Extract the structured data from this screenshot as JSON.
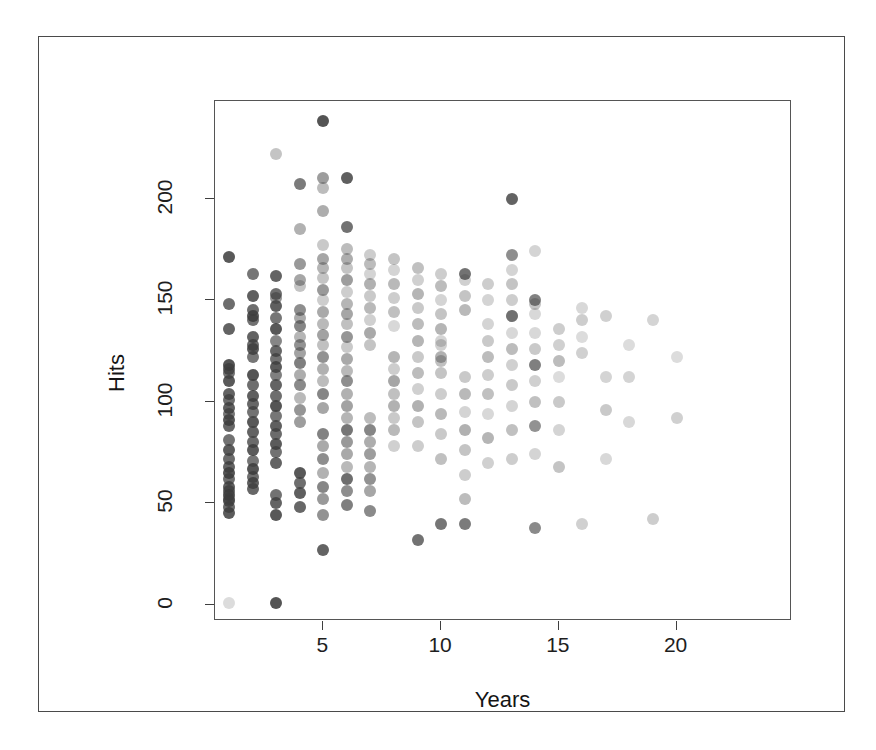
{
  "chart_data": {
    "type": "scatter",
    "title": "",
    "xlabel": "Years",
    "ylabel": "Hits",
    "xlim": [
      0.4,
      24.9
    ],
    "ylim": [
      -8,
      248
    ],
    "grid": false,
    "legend": "none",
    "xticks": [
      "5",
      "10",
      "15",
      "20"
    ],
    "xtick_values": [
      5,
      10,
      15,
      20
    ],
    "yticks": [
      "0",
      "50",
      "100",
      "150",
      "200"
    ],
    "ytick_values": [
      0,
      50,
      100,
      150,
      200
    ],
    "point_color": "#3c3c3c",
    "point_shape": "circle",
    "point_alpha_varies": true,
    "n_points": 322,
    "x": [
      1,
      1,
      1,
      1,
      1,
      1,
      1,
      1,
      1,
      1,
      1,
      1,
      1,
      1,
      1,
      1,
      1,
      1,
      1,
      1,
      1,
      1,
      1,
      1,
      1,
      1,
      1,
      2,
      2,
      2,
      2,
      2,
      2,
      2,
      2,
      2,
      2,
      2,
      2,
      2,
      2,
      2,
      2,
      2,
      2,
      2,
      2,
      2,
      2,
      2,
      3,
      3,
      3,
      3,
      3,
      3,
      3,
      3,
      3,
      3,
      3,
      3,
      3,
      3,
      3,
      3,
      3,
      3,
      3,
      3,
      3,
      3,
      3,
      3,
      3,
      4,
      4,
      4,
      4,
      4,
      4,
      4,
      4,
      4,
      4,
      4,
      4,
      4,
      4,
      4,
      4,
      4,
      4,
      4,
      4,
      4,
      5,
      5,
      5,
      5,
      5,
      5,
      5,
      5,
      5,
      5,
      5,
      5,
      5,
      5,
      5,
      5,
      5,
      5,
      5,
      5,
      5,
      5,
      5,
      5,
      5,
      5,
      5,
      6,
      6,
      6,
      6,
      6,
      6,
      6,
      6,
      6,
      6,
      6,
      6,
      6,
      6,
      6,
      6,
      6,
      6,
      6,
      6,
      6,
      6,
      6,
      6,
      6,
      7,
      7,
      7,
      7,
      7,
      7,
      7,
      7,
      7,
      7,
      7,
      7,
      7,
      7,
      7,
      7,
      7,
      8,
      8,
      8,
      8,
      8,
      8,
      8,
      8,
      8,
      8,
      8,
      8,
      8,
      8,
      9,
      9,
      9,
      9,
      9,
      9,
      9,
      9,
      9,
      9,
      9,
      9,
      9,
      10,
      10,
      10,
      10,
      10,
      10,
      10,
      10,
      10,
      10,
      10,
      10,
      10,
      10,
      10,
      11,
      11,
      11,
      11,
      11,
      11,
      11,
      11,
      11,
      11,
      11,
      11,
      12,
      12,
      12,
      12,
      12,
      12,
      12,
      12,
      12,
      12,
      13,
      13,
      13,
      13,
      13,
      13,
      13,
      13,
      13,
      13,
      13,
      13,
      13,
      13,
      14,
      14,
      14,
      14,
      14,
      14,
      14,
      14,
      14,
      14,
      14,
      14,
      15,
      15,
      15,
      15,
      15,
      15,
      15,
      16,
      16,
      16,
      16,
      16,
      17,
      17,
      17,
      17,
      18,
      18,
      18,
      19,
      19,
      20,
      20
    ],
    "y": [
      171,
      148,
      136,
      118,
      116,
      114,
      110,
      104,
      101,
      97,
      94,
      91,
      88,
      81,
      76,
      72,
      68,
      65,
      62,
      58,
      56,
      54,
      52,
      51,
      48,
      45,
      1,
      163,
      152,
      145,
      142,
      140,
      132,
      128,
      126,
      122,
      113,
      108,
      103,
      99,
      95,
      90,
      85,
      80,
      76,
      71,
      67,
      63,
      60,
      57,
      54,
      50,
      44,
      1,
      222,
      162,
      153,
      151,
      147,
      141,
      136,
      130,
      125,
      121,
      117,
      113,
      108,
      103,
      98,
      93,
      88,
      84,
      79,
      75,
      70,
      65,
      60,
      55,
      48,
      207,
      185,
      168,
      160,
      157,
      145,
      141,
      137,
      132,
      128,
      124,
      119,
      113,
      108,
      102,
      96,
      90,
      84,
      78,
      72,
      65,
      58,
      52,
      44,
      27,
      238,
      210,
      205,
      194,
      177,
      170,
      166,
      161,
      155,
      150,
      144,
      138,
      133,
      128,
      122,
      116,
      110,
      104,
      97,
      92,
      86,
      80,
      74,
      68,
      62,
      56,
      49,
      210,
      186,
      175,
      170,
      166,
      160,
      154,
      148,
      143,
      138,
      132,
      127,
      121,
      115,
      110,
      104,
      98,
      92,
      86,
      80,
      74,
      68,
      62,
      56,
      46,
      172,
      168,
      163,
      158,
      152,
      146,
      140,
      134,
      128,
      122,
      116,
      110,
      104,
      98,
      92,
      86,
      78,
      170,
      165,
      158,
      151,
      144,
      137,
      130,
      122,
      114,
      106,
      98,
      90,
      78,
      32,
      166,
      160,
      153,
      146,
      138,
      130,
      122,
      114,
      104,
      94,
      84,
      72,
      40,
      163,
      157,
      150,
      143,
      136,
      128,
      120,
      112,
      104,
      95,
      86,
      76,
      64,
      52,
      40,
      163,
      160,
      152,
      145,
      138,
      130,
      122,
      113,
      104,
      94,
      82,
      70,
      158,
      150,
      142,
      134,
      126,
      118,
      108,
      98,
      86,
      72,
      200,
      172,
      165,
      158,
      150,
      142,
      134,
      126,
      118,
      110,
      100,
      88,
      74,
      38,
      174,
      150,
      148,
      143,
      136,
      128,
      120,
      112,
      100,
      86,
      68,
      40,
      146,
      140,
      132,
      124,
      112,
      96,
      72,
      142,
      128,
      112,
      90,
      42,
      140,
      122,
      92,
      62,
      142,
      122,
      80,
      168,
      32,
      102,
      78
    ],
    "alpha": [
      0.85,
      0.75,
      0.8,
      0.88,
      0.78,
      0.72,
      0.85,
      0.8,
      0.75,
      0.82,
      0.7,
      0.86,
      0.78,
      0.72,
      0.84,
      0.76,
      0.8,
      0.88,
      0.74,
      0.82,
      0.78,
      0.86,
      0.72,
      0.8,
      0.76,
      0.84,
      0.18,
      0.7,
      0.82,
      0.74,
      0.86,
      0.72,
      0.8,
      0.76,
      0.84,
      0.7,
      0.88,
      0.74,
      0.82,
      0.78,
      0.72,
      0.86,
      0.8,
      0.76,
      0.84,
      0.7,
      0.88,
      0.74,
      0.82,
      0.78,
      0.72,
      0.8,
      0.86,
      0.88,
      0.3,
      0.8,
      0.74,
      0.55,
      0.82,
      0.7,
      0.86,
      0.62,
      0.78,
      0.72,
      0.84,
      0.66,
      0.8,
      0.74,
      0.88,
      0.7,
      0.82,
      0.76,
      0.84,
      0.72,
      0.8,
      0.86,
      0.74,
      0.82,
      0.78,
      0.68,
      0.4,
      0.52,
      0.46,
      0.3,
      0.58,
      0.44,
      0.62,
      0.38,
      0.56,
      0.48,
      0.66,
      0.42,
      0.6,
      0.36,
      0.54,
      0.5,
      0.64,
      0.44,
      0.58,
      0.4,
      0.62,
      0.52,
      0.56,
      0.8,
      0.88,
      0.5,
      0.34,
      0.42,
      0.28,
      0.46,
      0.38,
      0.3,
      0.52,
      0.26,
      0.44,
      0.36,
      0.48,
      0.32,
      0.56,
      0.4,
      0.34,
      0.62,
      0.46,
      0.38,
      0.7,
      0.52,
      0.44,
      0.36,
      0.74,
      0.58,
      0.66,
      0.82,
      0.72,
      0.34,
      0.42,
      0.3,
      0.5,
      0.26,
      0.38,
      0.46,
      0.32,
      0.54,
      0.28,
      0.44,
      0.36,
      0.58,
      0.4,
      0.48,
      0.34,
      0.62,
      0.42,
      0.5,
      0.38,
      0.56,
      0.46,
      0.6,
      0.26,
      0.34,
      0.22,
      0.4,
      0.28,
      0.36,
      0.24,
      0.44,
      0.3,
      0.38,
      0.26,
      0.46,
      0.32,
      0.4,
      0.28,
      0.36,
      0.24,
      0.3,
      0.22,
      0.36,
      0.26,
      0.32,
      0.2,
      0.38,
      0.28,
      0.34,
      0.24,
      0.4,
      0.3,
      0.26,
      0.72,
      0.32,
      0.24,
      0.38,
      0.28,
      0.34,
      0.22,
      0.4,
      0.3,
      0.26,
      0.36,
      0.28,
      0.32,
      0.7,
      0.26,
      0.34,
      0.22,
      0.3,
      0.38,
      0.24,
      0.32,
      0.28,
      0.36,
      0.22,
      0.4,
      0.3,
      0.26,
      0.34,
      0.68,
      0.72,
      0.24,
      0.3,
      0.36,
      0.22,
      0.28,
      0.34,
      0.26,
      0.32,
      0.2,
      0.38,
      0.24,
      0.26,
      0.22,
      0.3,
      0.2,
      0.34,
      0.24,
      0.28,
      0.22,
      0.32,
      0.26,
      0.8,
      0.58,
      0.22,
      0.3,
      0.26,
      0.62,
      0.2,
      0.28,
      0.66,
      0.24,
      0.32,
      0.56,
      0.22,
      0.6,
      0.22,
      0.64,
      0.3,
      0.2,
      0.26,
      0.24,
      0.34,
      0.18,
      0.28,
      0.22,
      0.3,
      0.24,
      0.2,
      0.26,
      0.18,
      0.24,
      0.22,
      0.28,
      0.2,
      0.24,
      0.18,
      0.22,
      0.2,
      0.26,
      0.22,
      0.18,
      0.24,
      0.2,
      0.2,
      0.22,
      0.18,
      0.16,
      0.2,
      0.18,
      0.58
    ]
  },
  "axes": {
    "y_title": "Hits",
    "x_title": "Years"
  }
}
